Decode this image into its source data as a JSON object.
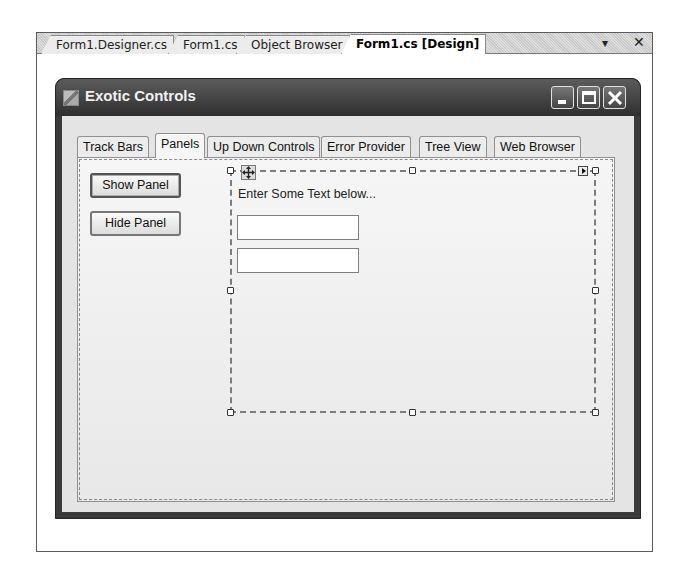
{
  "doc_tabs": [
    {
      "label": "Form1.Designer.cs",
      "active": false
    },
    {
      "label": "Form1.cs",
      "active": false
    },
    {
      "label": "Object Browser",
      "active": false
    },
    {
      "label": "Form1.cs [Design]",
      "active": true
    }
  ],
  "doc_controls": {
    "dropdown": "▾",
    "close": "✕"
  },
  "form": {
    "title": "Exotic Controls",
    "icon": "form-icon",
    "window_buttons": [
      "minimize",
      "maximize",
      "close"
    ]
  },
  "tab_control": {
    "tabs": [
      {
        "label": "Track Bars",
        "active": false
      },
      {
        "label": "Panels",
        "active": true
      },
      {
        "label": "Up Down Controls",
        "active": false
      },
      {
        "label": "Error Provider",
        "active": false
      },
      {
        "label": "Tree View",
        "active": false
      },
      {
        "label": "Web Browser",
        "active": false
      }
    ]
  },
  "panels_page": {
    "show_button": "Show Panel",
    "hide_button": "Hide Panel",
    "panel": {
      "label": "Enter Some Text below...",
      "textbox1_value": "",
      "textbox2_value": ""
    }
  },
  "colors": {
    "titlebar": "#3a3a3a",
    "client": "#e4e4e4",
    "selection_border": "#7d7d7d"
  }
}
